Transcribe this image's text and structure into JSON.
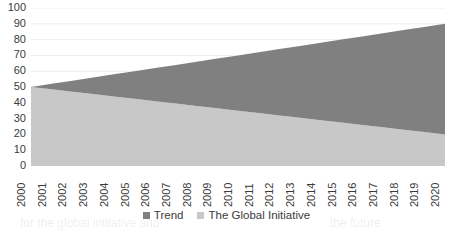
{
  "chart_data": {
    "type": "area",
    "stacked": true,
    "title": "",
    "subtitle": "",
    "xlabel": "",
    "ylabel": "",
    "categories": [
      "2000",
      "2001",
      "2002",
      "2003",
      "2004",
      "2005",
      "2006",
      "2007",
      "2008",
      "2009",
      "2010",
      "2011",
      "2012",
      "2013",
      "2014",
      "2015",
      "2016",
      "2017",
      "2018",
      "2019",
      "2020"
    ],
    "series": [
      {
        "name": "The Global Initiative",
        "color": "#c8c8c8",
        "values": [
          50,
          48.5,
          47,
          45.5,
          44,
          42.5,
          41,
          39.5,
          38,
          36.5,
          35,
          33.5,
          32,
          30.5,
          29,
          27.5,
          26,
          24.5,
          23,
          21.5,
          20
        ]
      },
      {
        "name": "Trend",
        "color": "#808080",
        "values": [
          0,
          3.5,
          7,
          10.5,
          14,
          17.5,
          21,
          24.5,
          28,
          31.5,
          35,
          38.5,
          42,
          45.5,
          49,
          52.5,
          56,
          59.5,
          63,
          66.5,
          70
        ]
      }
    ],
    "stack_totals": [
      50,
      52,
      54,
      56,
      58,
      60,
      62,
      64,
      66,
      68,
      70,
      72,
      74,
      76,
      78,
      80,
      82,
      84,
      86,
      88,
      90
    ],
    "ylim": [
      0,
      100
    ],
    "yticks": [
      0,
      10,
      20,
      30,
      40,
      50,
      60,
      70,
      80,
      90,
      100
    ],
    "ytick_labels": [
      "0",
      "10",
      "20",
      "30",
      "40",
      "50",
      "60",
      "70",
      "80",
      "90",
      "100"
    ],
    "grid": true,
    "grid_color": "#e9e9e9",
    "legend_position": "bottom"
  },
  "legend": {
    "items": [
      {
        "label": "Trend",
        "color": "#808080"
      },
      {
        "label": "The Global Initiative",
        "color": "#c8c8c8"
      }
    ]
  },
  "ghost_text": {
    "line_a": "the cause of the problem and a more effective",
    "line_b": "for the global initiative and",
    "line_c": "the future"
  }
}
